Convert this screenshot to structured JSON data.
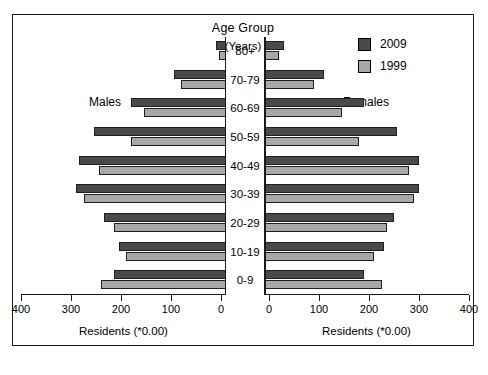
{
  "chart_data": {
    "type": "bar",
    "subtype": "population-pyramid",
    "title": "Age Group",
    "subtitle": "(Years)",
    "left_panel_label": "Males",
    "right_panel_label": "Females",
    "xlabel": "Residents (*0.00)",
    "ylabel": "",
    "categories": [
      "80+",
      "70-79",
      "60-69",
      "50-59",
      "40-49",
      "30-39",
      "20-29",
      "10-19",
      "0-9"
    ],
    "legend": [
      {
        "name": "2009",
        "color": "#4a4a4a"
      },
      {
        "name": "1999",
        "color": "#a8a8a8"
      }
    ],
    "legend_position": "top-right",
    "grid": false,
    "xlim_left": [
      400,
      0
    ],
    "xlim_right": [
      0,
      400
    ],
    "ticks_left": [
      "400",
      "300",
      "200",
      "100",
      "0"
    ],
    "ticks_right": [
      "0",
      "100",
      "200",
      "300",
      "400"
    ],
    "tick_values": [
      0,
      100,
      200,
      300,
      400
    ],
    "axis_max": 400,
    "males": {
      "series": [
        {
          "name": "2009",
          "values": [
            20,
            105,
            190,
            265,
            295,
            300,
            245,
            215,
            225
          ]
        },
        {
          "name": "1999",
          "values": [
            15,
            90,
            165,
            190,
            255,
            285,
            225,
            200,
            250
          ]
        }
      ]
    },
    "females": {
      "series": [
        {
          "name": "2009",
          "values": [
            40,
            120,
            200,
            265,
            310,
            310,
            260,
            240,
            200
          ]
        },
        {
          "name": "1999",
          "values": [
            30,
            100,
            155,
            190,
            290,
            300,
            245,
            220,
            235
          ]
        }
      ]
    }
  },
  "colors": {
    "series_2009": "#4a4a4a",
    "series_1999": "#a8a8a8",
    "axis": "#1a1a1a",
    "background": "#ffffff"
  }
}
